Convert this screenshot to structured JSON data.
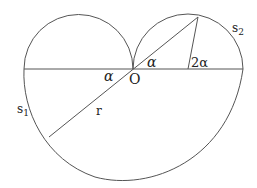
{
  "diagram": {
    "labels": {
      "origin": "O",
      "alpha_left": "α",
      "alpha_right": "α",
      "two_alpha": "2α",
      "radius": "r",
      "s1": "s",
      "s1_sub": "1",
      "s2": "s",
      "s2_sub": "2"
    },
    "points": {
      "O": [
        133,
        69
      ],
      "left_end": [
        24,
        69
      ],
      "right_end": [
        243,
        69
      ],
      "right_circle_center": [
        188,
        69
      ],
      "top_point": [
        198,
        17
      ],
      "lower_left_point": [
        49,
        137
      ]
    },
    "stroke_color": "#555555"
  }
}
